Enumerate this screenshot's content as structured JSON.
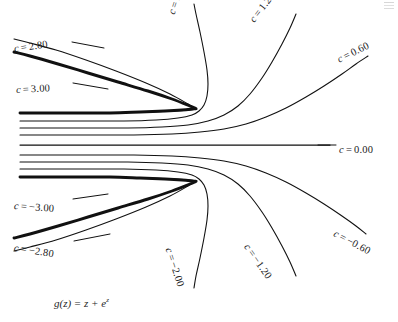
{
  "figure": {
    "title_caption": "g(z) = z + e",
    "caption_exponent": "z",
    "caption_function_name": "g",
    "caption_variable": "z",
    "caption_operator": "+",
    "caption_equals": "=",
    "corner_mark": "page-edge-artifact"
  },
  "labels": {
    "upper": [
      {
        "id": "c-2-80",
        "text": "c = 2.80",
        "value": 2.8,
        "x": 14,
        "y": 44,
        "rotate": 8
      },
      {
        "id": "c-3-00",
        "text": "c = 3.00",
        "value": 3.0,
        "x": 16,
        "y": 85,
        "rotate": 3
      },
      {
        "id": "c-2-00",
        "text": "c = 2.00",
        "value": 2.0,
        "x": 172,
        "y": 9,
        "rotate": 72
      },
      {
        "id": "c-1-20",
        "text": "c = 1.20",
        "value": 1.2,
        "x": 252,
        "y": 16,
        "rotate": 52
      },
      {
        "id": "c-0-60",
        "text": "c = 0.60",
        "value": 0.6,
        "x": 338,
        "y": 55,
        "rotate": 26
      },
      {
        "id": "c-0-00",
        "text": "c = 0.00",
        "value": 0.0,
        "x": 339,
        "y": 145,
        "rotate": 0
      }
    ],
    "lower": [
      {
        "id": "c-neg-3-00",
        "text": "c = −3.00",
        "value": -3.0,
        "x": 14,
        "y": 201,
        "rotate": -4
      },
      {
        "id": "c-neg-2-80",
        "text": "c = −2.80",
        "value": -2.8,
        "x": 14,
        "y": 243,
        "rotate": -9
      },
      {
        "id": "c-neg-2-00",
        "text": "c = −2.00",
        "value": -2.0,
        "x": 168,
        "y": 243,
        "rotate": -72
      },
      {
        "id": "c-neg-1-20",
        "text": "c = −1.20",
        "value": -1.2,
        "x": 246,
        "y": 240,
        "rotate": -55
      },
      {
        "id": "c-neg-0-60",
        "text": "c = −0.60",
        "value": -0.6,
        "x": 334,
        "y": 228,
        "rotate": -28
      }
    ]
  },
  "chart_data": {
    "type": "line",
    "subtitle": "g(z) = z + e^z",
    "xlabel": "",
    "ylabel": "",
    "grid": false,
    "legend_position": "inline-curve-labels",
    "axis_visible": false,
    "contour_variable": "c",
    "contour_levels": [
      3.0,
      2.8,
      2.0,
      1.2,
      0.6,
      0.0,
      -0.6,
      -1.2,
      -2.0,
      -2.8,
      -3.0
    ],
    "level_labels": [
      "c = 3.00",
      "c = 2.80",
      "c = 2.00",
      "c = 1.20",
      "c = 0.60",
      "c = 0.00",
      "c = −0.60",
      "c = −1.20",
      "c = −2.00",
      "c = −2.80",
      "c = −3.00"
    ],
    "saddle_points": [
      {
        "x": 196,
        "y": 108,
        "label": "upper-saddle"
      },
      {
        "x": 196,
        "y": 181,
        "label": "lower-saddle"
      }
    ],
    "series": [
      {
        "name": "c = 3.00",
        "weight": "heavy",
        "points": [
          [
            20,
            113
          ],
          [
            70,
            113
          ],
          [
            110,
            113
          ],
          [
            140,
            112
          ],
          [
            165,
            111
          ],
          [
            182,
            110
          ],
          [
            192,
            109
          ],
          [
            196,
            108.5
          ],
          [
            190,
            106
          ],
          [
            172,
            99
          ],
          [
            148,
            91
          ],
          [
            118,
            82
          ],
          [
            88,
            73
          ],
          [
            58,
            64
          ],
          [
            30,
            56
          ],
          [
            14,
            52
          ]
        ]
      },
      {
        "name": "c = 2.80",
        "weight": "normal",
        "points": [
          [
            20,
            113
          ],
          [
            80,
            113
          ],
          [
            120,
            112.5
          ],
          [
            152,
            112
          ],
          [
            176,
            111
          ],
          [
            190,
            110
          ],
          [
            196,
            109
          ],
          [
            196,
            109
          ],
          [
            188,
            104
          ],
          [
            170,
            94
          ],
          [
            146,
            83
          ],
          [
            116,
            71
          ],
          [
            86,
            60
          ],
          [
            56,
            50
          ],
          [
            30,
            43
          ],
          [
            14,
            39
          ]
        ]
      },
      {
        "name": "c = 2.00-upper-branch",
        "weight": "normal",
        "points": [
          [
            20,
            121
          ],
          [
            80,
            121
          ],
          [
            124,
            121
          ],
          [
            156,
            120
          ],
          [
            178,
            118
          ],
          [
            192,
            115
          ],
          [
            199,
            111
          ],
          [
            204,
            105
          ],
          [
            207,
            96
          ],
          [
            208,
            84
          ],
          [
            207,
            70
          ],
          [
            204,
            52
          ],
          [
            200,
            32
          ],
          [
            196,
            14
          ],
          [
            194,
            4
          ]
        ]
      },
      {
        "name": "c = 1.20",
        "weight": "normal",
        "points": [
          [
            20,
            128
          ],
          [
            84,
            128
          ],
          [
            128,
            128
          ],
          [
            162,
            127
          ],
          [
            188,
            125
          ],
          [
            208,
            121
          ],
          [
            224,
            115
          ],
          [
            238,
            106
          ],
          [
            250,
            94
          ],
          [
            262,
            78
          ],
          [
            272,
            62
          ],
          [
            282,
            44
          ],
          [
            290,
            28
          ],
          [
            296,
            14
          ]
        ]
      },
      {
        "name": "c = 0.60",
        "weight": "normal",
        "points": [
          [
            20,
            135
          ],
          [
            88,
            135
          ],
          [
            134,
            135
          ],
          [
            172,
            134
          ],
          [
            200,
            132
          ],
          [
            224,
            129
          ],
          [
            246,
            124
          ],
          [
            266,
            117
          ],
          [
            286,
            108
          ],
          [
            306,
            97
          ],
          [
            324,
            86
          ],
          [
            342,
            74
          ],
          [
            356,
            64
          ],
          [
            368,
            56
          ]
        ]
      },
      {
        "name": "c = 0.00",
        "weight": "mid",
        "points": [
          [
            20,
            145
          ],
          [
            100,
            145
          ],
          [
            160,
            145
          ],
          [
            200,
            145
          ],
          [
            240,
            145
          ],
          [
            280,
            145
          ],
          [
            310,
            145
          ],
          [
            330,
            145
          ]
        ]
      },
      {
        "name": "c = −0.60",
        "weight": "normal",
        "points": [
          [
            20,
            155
          ],
          [
            88,
            155
          ],
          [
            134,
            155
          ],
          [
            172,
            156
          ],
          [
            200,
            158
          ],
          [
            224,
            161
          ],
          [
            246,
            166
          ],
          [
            266,
            173
          ],
          [
            286,
            182
          ],
          [
            306,
            193
          ],
          [
            324,
            204
          ],
          [
            342,
            216
          ],
          [
            356,
            226
          ],
          [
            366,
            234
          ]
        ]
      },
      {
        "name": "c = −1.20",
        "weight": "normal",
        "points": [
          [
            20,
            162
          ],
          [
            84,
            162
          ],
          [
            128,
            162
          ],
          [
            162,
            163
          ],
          [
            188,
            165
          ],
          [
            208,
            169
          ],
          [
            224,
            175
          ],
          [
            238,
            184
          ],
          [
            250,
            196
          ],
          [
            262,
            212
          ],
          [
            272,
            228
          ],
          [
            282,
            246
          ],
          [
            290,
            262
          ],
          [
            296,
            276
          ]
        ]
      },
      {
        "name": "c = −2.00-lower-branch",
        "weight": "normal",
        "points": [
          [
            20,
            169
          ],
          [
            80,
            169
          ],
          [
            124,
            169
          ],
          [
            156,
            170
          ],
          [
            178,
            172
          ],
          [
            192,
            175
          ],
          [
            199,
            179
          ],
          [
            204,
            185
          ],
          [
            207,
            194
          ],
          [
            208,
            206
          ],
          [
            207,
            220
          ],
          [
            204,
            238
          ],
          [
            200,
            258
          ],
          [
            196,
            276
          ],
          [
            194,
            288
          ]
        ]
      },
      {
        "name": "c = −2.80",
        "weight": "normal",
        "points": [
          [
            20,
            177
          ],
          [
            80,
            177
          ],
          [
            120,
            177.5
          ],
          [
            152,
            178
          ],
          [
            176,
            179
          ],
          [
            190,
            180
          ],
          [
            196,
            181
          ],
          [
            196,
            181
          ],
          [
            188,
            186
          ],
          [
            170,
            196
          ],
          [
            146,
            207
          ],
          [
            116,
            219
          ],
          [
            86,
            230
          ],
          [
            56,
            240
          ],
          [
            30,
            247
          ],
          [
            14,
            251
          ]
        ]
      },
      {
        "name": "c = −3.00",
        "weight": "heavy",
        "points": [
          [
            20,
            177
          ],
          [
            70,
            177
          ],
          [
            110,
            177
          ],
          [
            140,
            178
          ],
          [
            165,
            179
          ],
          [
            182,
            180
          ],
          [
            192,
            181
          ],
          [
            196,
            181.5
          ],
          [
            190,
            184
          ],
          [
            172,
            191
          ],
          [
            148,
            199
          ],
          [
            118,
            208
          ],
          [
            88,
            217
          ],
          [
            58,
            226
          ],
          [
            30,
            234
          ],
          [
            14,
            238
          ]
        ]
      }
    ],
    "leader_lines": [
      {
        "name": "leader-c-2-80",
        "from": [
          72,
          42
        ],
        "to": [
          104,
          48
        ]
      },
      {
        "name": "leader-c-3-00",
        "from": [
          73,
          83
        ],
        "to": [
          108,
          89
        ]
      },
      {
        "name": "leader-c-neg-3-00",
        "from": [
          73,
          199
        ],
        "to": [
          108,
          194
        ]
      },
      {
        "name": "leader-c-neg-2-80",
        "from": [
          74,
          241
        ],
        "to": [
          110,
          234
        ]
      },
      {
        "name": "leader-c-0-00",
        "from": [
          318,
          145
        ],
        "to": [
          336,
          145
        ]
      }
    ]
  }
}
